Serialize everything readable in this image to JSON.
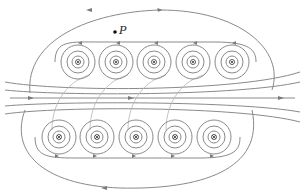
{
  "diagram": {
    "point_label": "P",
    "point": {
      "x": 115,
      "y": 32
    },
    "colors": {
      "field_line": "#8a8a8a",
      "arrow": "#7a7a7a",
      "conductor": "#333333",
      "point": "#111111",
      "background": "#ffffff"
    },
    "top_row": {
      "direction": "out-of-page",
      "symbol": "dot",
      "y": 62,
      "x": [
        78,
        116,
        154,
        193,
        232
      ]
    },
    "bottom_row": {
      "direction": "into-page",
      "symbol": "cross",
      "y": 137,
      "x": [
        59,
        97,
        136,
        175,
        214
      ]
    },
    "ring_radii": [
      6,
      11,
      17
    ]
  }
}
